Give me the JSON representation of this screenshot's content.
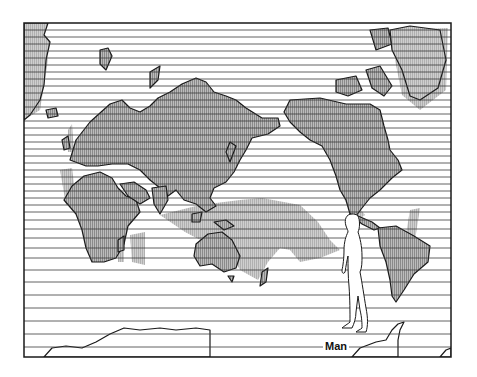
{
  "figure": {
    "subject_label": "Man",
    "frame": {
      "x": 24,
      "y": 23,
      "width": 427,
      "height": 334
    },
    "colors": {
      "land_fill": "#a9a9a9",
      "range_fill": "#bdbdbd",
      "outline": "#1a1a1a",
      "latitude_lines": "#3a3a3a",
      "background": "#ffffff"
    },
    "latitude_lines_y": [
      30,
      37,
      44,
      51,
      58,
      65,
      72,
      79,
      86,
      93,
      100,
      107,
      114,
      121,
      128,
      135,
      142,
      149,
      156,
      163,
      170,
      177,
      184,
      191,
      198,
      205,
      212,
      220,
      229,
      238,
      248,
      258,
      270,
      282,
      295,
      308,
      321,
      334,
      347
    ],
    "legend": "Shaded areas show distribution range; figure of a walking man for scale"
  }
}
